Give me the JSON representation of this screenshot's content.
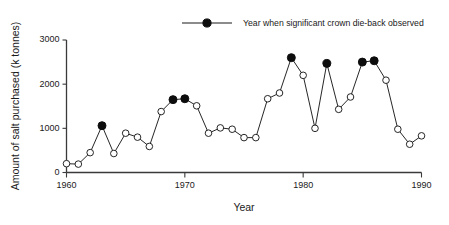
{
  "chart_data": {
    "type": "line",
    "title": "",
    "xlabel": "Year",
    "ylabel": "Amount of salt purchased (k tonnes)",
    "xlim": [
      1960,
      1990
    ],
    "ylim": [
      0,
      3000
    ],
    "xticks": [
      1960,
      1970,
      1980,
      1990
    ],
    "yticks": [
      0,
      1000,
      2000,
      3000
    ],
    "xtick_labels": [
      "1960",
      "1970",
      "1980",
      "1990"
    ],
    "ytick_labels": [
      "0",
      "1000",
      "2000",
      "3000"
    ],
    "grid": false,
    "legend_position": "top-center",
    "legend": [
      {
        "label": "Year when significant crown die-back observed",
        "marker": "filled-circle"
      }
    ],
    "x": [
      1960,
      1961,
      1962,
      1963,
      1964,
      1965,
      1966,
      1967,
      1968,
      1969,
      1970,
      1971,
      1972,
      1973,
      1974,
      1975,
      1976,
      1977,
      1978,
      1979,
      1980,
      1981,
      1982,
      1983,
      1984,
      1985,
      1986,
      1987,
      1988,
      1989,
      1990
    ],
    "values": [
      200,
      190,
      450,
      1060,
      430,
      890,
      800,
      590,
      1380,
      1650,
      1670,
      1510,
      890,
      1010,
      980,
      790,
      790,
      1670,
      1800,
      2600,
      2200,
      1000,
      2470,
      1430,
      1710,
      2500,
      2530,
      2090,
      980,
      640,
      830
    ],
    "marker_filled": [
      false,
      false,
      false,
      true,
      false,
      false,
      false,
      false,
      false,
      true,
      true,
      false,
      false,
      false,
      false,
      false,
      false,
      false,
      false,
      true,
      false,
      false,
      true,
      false,
      false,
      true,
      true,
      false,
      false,
      false,
      false
    ],
    "highlight_years": [
      1963,
      1969,
      1970,
      1979,
      1982,
      1985,
      1986
    ],
    "series": [
      {
        "name": "Amount of salt purchased (k tonnes)",
        "values": [
          200,
          190,
          450,
          1060,
          430,
          890,
          800,
          590,
          1380,
          1650,
          1670,
          1510,
          890,
          1010,
          980,
          790,
          790,
          1670,
          1800,
          2600,
          2200,
          1000,
          2470,
          1430,
          1710,
          2500,
          2530,
          2090,
          980,
          640,
          830
        ]
      }
    ],
    "colors": {
      "line": "#1a1a1a",
      "marker_open_fill": "#ffffff",
      "marker_filled_fill": "#0d0d0d",
      "axis": "#3a3a3a",
      "background": "#ffffff"
    }
  }
}
